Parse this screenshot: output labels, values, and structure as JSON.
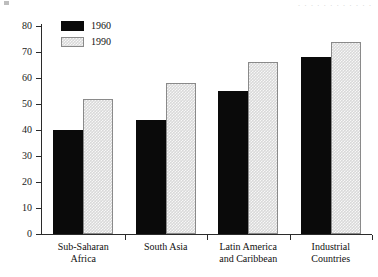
{
  "chart_data": {
    "type": "bar",
    "title": "",
    "xlabel": "",
    "ylabel": "",
    "ylim": [
      0,
      80
    ],
    "yticks": [
      0,
      10,
      20,
      30,
      40,
      50,
      60,
      70,
      80
    ],
    "grid": false,
    "legend_position": "top-left",
    "categories": [
      "Sub-Saharan Africa",
      "South Asia",
      "Latin America and Caribbean",
      "Industrial Countries"
    ],
    "category_lines": [
      [
        "Sub-Saharan",
        "Africa"
      ],
      [
        "South Asia",
        ""
      ],
      [
        "Latin America",
        "and Caribbean"
      ],
      [
        "Industrial",
        "Countries"
      ]
    ],
    "series": [
      {
        "name": "1960",
        "color": "#0a0a0a",
        "values": [
          40,
          44,
          55,
          68
        ]
      },
      {
        "name": "1990",
        "color": "#d9d9d9",
        "values": [
          52,
          58,
          66,
          74
        ]
      }
    ]
  },
  "legend": {
    "items": [
      {
        "label": "1960"
      },
      {
        "label": "1990"
      }
    ]
  },
  "header": {
    "title_remnant": "· · · · · · · · · · · ·"
  }
}
